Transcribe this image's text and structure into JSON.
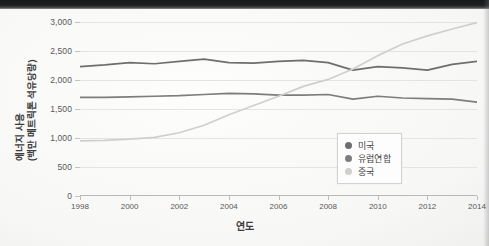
{
  "chart_data": {
    "type": "line",
    "title": "",
    "xlabel": "연도",
    "ylabel": "에너지 사용 (백만 메트릭톤 석유당량)",
    "ylabel_line1": "에너지 사용",
    "ylabel_line2": "(백만 메트릭톤 석유당량)",
    "grid": true,
    "legend_position": "lower-right-inside",
    "xlim": [
      1998,
      2014
    ],
    "ylim": [
      0,
      3000
    ],
    "ytick_values": [
      0,
      500,
      1000,
      1500,
      2000,
      2500,
      3000
    ],
    "ytick_labels": [
      "0",
      "500",
      "1,000",
      "1,500",
      "2,000",
      "2,500",
      "3,000"
    ],
    "xtick_values": [
      1998,
      2000,
      2002,
      2004,
      2006,
      2008,
      2010,
      2012,
      2014
    ],
    "xtick_labels": [
      "1998",
      "2000",
      "2002",
      "2004",
      "2006",
      "2008",
      "2010",
      "2012",
      "2014"
    ],
    "x": [
      1998,
      1999,
      2000,
      2001,
      2002,
      2003,
      2004,
      2005,
      2006,
      2007,
      2008,
      2009,
      2010,
      2011,
      2012,
      2013,
      2014
    ],
    "series": [
      {
        "name": "미국",
        "color": "#6e6e70",
        "values": [
          2230,
          2260,
          2300,
          2280,
          2320,
          2360,
          2300,
          2290,
          2320,
          2340,
          2300,
          2170,
          2230,
          2210,
          2170,
          2270,
          2320
        ]
      },
      {
        "name": "유럽연합",
        "color": "#7d7d7f",
        "values": [
          1700,
          1700,
          1710,
          1720,
          1730,
          1750,
          1770,
          1760,
          1740,
          1740,
          1750,
          1670,
          1720,
          1690,
          1680,
          1670,
          1620
        ]
      },
      {
        "name": "중국",
        "color": "#cfcfcd",
        "values": [
          950,
          960,
          980,
          1010,
          1090,
          1220,
          1400,
          1560,
          1720,
          1890,
          2010,
          2190,
          2420,
          2620,
          2760,
          2880,
          2990
        ]
      }
    ]
  },
  "legend": {
    "items": [
      {
        "label": "미국",
        "color": "#6e6e70"
      },
      {
        "label": "유럽연합",
        "color": "#7d7d7f"
      },
      {
        "label": "중국",
        "color": "#cfcfcd"
      }
    ]
  }
}
